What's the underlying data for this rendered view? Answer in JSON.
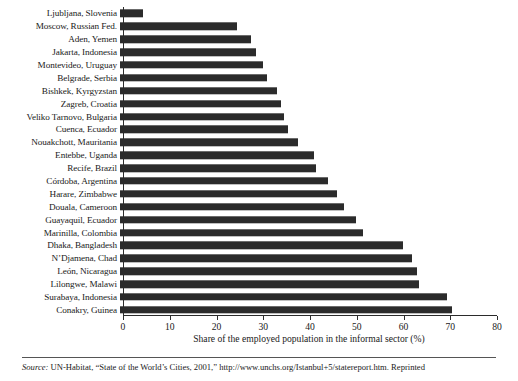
{
  "chart_data": {
    "type": "bar",
    "orientation": "horizontal",
    "title": "",
    "xlabel": "Share of the employed population in the informal sector (%)",
    "ylabel": "",
    "xlim": [
      0,
      80
    ],
    "xticks": [
      0,
      10,
      20,
      30,
      40,
      50,
      60,
      70,
      80
    ],
    "grid": false,
    "legend": null,
    "bar_color": "#2b2b2b",
    "categories": [
      "Ljubljana, Slovenia",
      "Moscow, Russian Fed.",
      "Aden, Yemen",
      "Jakarta, Indonesia",
      "Montevideo, Uruguay",
      "Belgrade, Serbia",
      "Bishkek, Kyrgyzstan",
      "Zagreb, Croatia",
      "Veliko Tarnovo, Bulgaria",
      "Cuenca, Ecuador",
      "Nouakchott, Mauritania",
      "Entebbe, Uganda",
      "Recife, Brazil",
      "Córdoba, Argentina",
      "Harare, Zimbabwe",
      "Douala, Cameroon",
      "Guayaquil, Ecuador",
      "Marinilla, Colombia",
      "Dhaka, Bangladesh",
      "N’Djamena, Chad",
      "León, Nicaragua",
      "Lilongwe, Malawi",
      "Surabaya, Indonesia",
      "Conakry, Guinea"
    ],
    "values": [
      5,
      25,
      28,
      29,
      30.5,
      31.5,
      33.5,
      34.5,
      35,
      36,
      38,
      41.5,
      42,
      44.5,
      46.5,
      48,
      50.5,
      52,
      60.5,
      62.5,
      63.5,
      64,
      70,
      71
    ]
  },
  "axis": {
    "tick_labels": [
      "0",
      "10",
      "20",
      "30",
      "40",
      "50",
      "60",
      "70",
      "80"
    ],
    "x_title": "Share of the employed population in the informal sector (%)"
  },
  "source": {
    "label": "Source:",
    "text": "UN-Habitat, “State of the World’s Cities, 2001,” http://www.unchs.org/Istanbul+5/statereport.htm. Reprinted"
  }
}
